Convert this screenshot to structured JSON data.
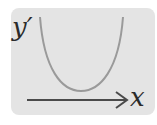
{
  "diagram": {
    "y_label": "y′",
    "x_label": "x",
    "curve": {
      "shape": "parabola-opening-up",
      "color": "#9a9a9a"
    },
    "axis": {
      "direction": "right-arrow",
      "color": "#4a4a4a"
    },
    "background_color": "#e4e4e4"
  }
}
